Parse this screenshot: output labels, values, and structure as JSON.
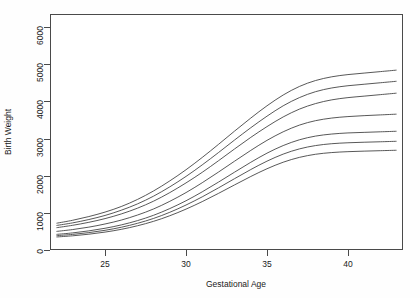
{
  "chart_data": {
    "type": "line",
    "title": "",
    "xlabel": "Gestational Age",
    "ylabel": "Birth Weight",
    "xlim": [
      21.6,
      43.4
    ],
    "ylim": [
      0,
      6350
    ],
    "xticks": [
      25,
      30,
      35,
      40
    ],
    "yticks": [
      0,
      1000,
      2000,
      3000,
      4000,
      5000,
      6000
    ],
    "grid": false,
    "legend": "none",
    "x": [
      22,
      23,
      24,
      25,
      26,
      27,
      28,
      29,
      30,
      31,
      32,
      33,
      34,
      35,
      36,
      37,
      38,
      39,
      40,
      41,
      42,
      43
    ],
    "series": [
      {
        "name": "curve-1",
        "values": [
          720,
          800,
          900,
          1020,
          1170,
          1360,
          1590,
          1860,
          2160,
          2490,
          2840,
          3200,
          3550,
          3880,
          4170,
          4400,
          4560,
          4660,
          4720,
          4760,
          4800,
          4840
        ]
      },
      {
        "name": "curve-2",
        "values": [
          660,
          730,
          820,
          930,
          1070,
          1240,
          1450,
          1700,
          1980,
          2290,
          2620,
          2960,
          3290,
          3600,
          3880,
          4100,
          4260,
          4360,
          4420,
          4460,
          4500,
          4540
        ]
      },
      {
        "name": "curve-3",
        "values": [
          600,
          665,
          745,
          845,
          970,
          1125,
          1315,
          1545,
          1805,
          2090,
          2400,
          2720,
          3030,
          3320,
          3580,
          3790,
          3940,
          4040,
          4100,
          4140,
          4180,
          4220
        ]
      },
      {
        "name": "curve-4",
        "values": [
          500,
          550,
          615,
          700,
          805,
          940,
          1105,
          1310,
          1545,
          1810,
          2095,
          2390,
          2680,
          2950,
          3180,
          3360,
          3480,
          3550,
          3590,
          3615,
          3635,
          3655
        ]
      },
      {
        "name": "curve-5",
        "values": [
          420,
          460,
          515,
          585,
          675,
          790,
          935,
          1115,
          1325,
          1565,
          1825,
          2095,
          2360,
          2605,
          2810,
          2965,
          3065,
          3120,
          3150,
          3165,
          3180,
          3195
        ]
      },
      {
        "name": "curve-6",
        "values": [
          385,
          420,
          468,
          530,
          612,
          718,
          850,
          1015,
          1210,
          1430,
          1670,
          1920,
          2165,
          2390,
          2580,
          2720,
          2810,
          2860,
          2885,
          2900,
          2912,
          2925
        ]
      },
      {
        "name": "curve-7",
        "values": [
          350,
          382,
          425,
          482,
          556,
          652,
          772,
          922,
          1100,
          1302,
          1522,
          1752,
          1978,
          2186,
          2362,
          2492,
          2576,
          2622,
          2646,
          2660,
          2672,
          2684
        ]
      }
    ]
  },
  "axes": {
    "y_tick_labels": [
      "0",
      "1000",
      "2000",
      "3000",
      "4000",
      "5000",
      "6000"
    ],
    "x_tick_labels": [
      "25",
      "30",
      "35",
      "40"
    ],
    "x_title": "Gestational Age",
    "y_title": "Birth Weight"
  },
  "header": {
    "title": ""
  },
  "style": {
    "line_color": "#3a3a3a",
    "frame_color": "#4a4a4a",
    "background": "#ffffff"
  }
}
